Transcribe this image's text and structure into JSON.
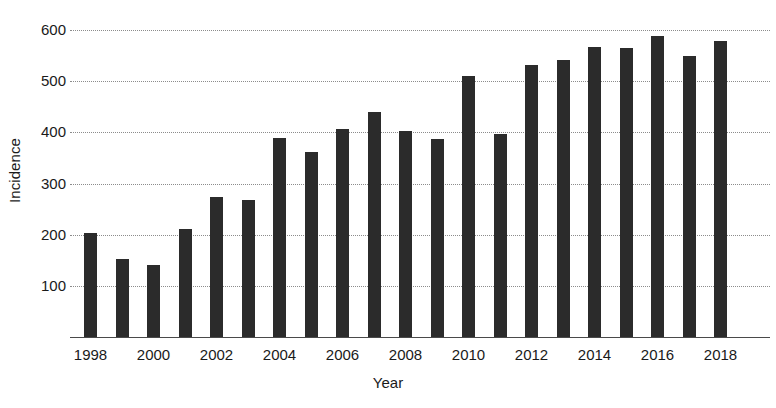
{
  "chart_data": {
    "type": "bar",
    "title": "",
    "xlabel": "Year",
    "ylabel": "Incidence",
    "categories": [
      1998,
      1999,
      2000,
      2001,
      2002,
      2003,
      2004,
      2005,
      2006,
      2007,
      2008,
      2009,
      2010,
      2011,
      2012,
      2013,
      2014,
      2015,
      2016,
      2017,
      2018
    ],
    "values": [
      204,
      152,
      140,
      212,
      273,
      268,
      389,
      361,
      407,
      441,
      402,
      388,
      510,
      398,
      532,
      541,
      568,
      566,
      588,
      549,
      578
    ],
    "ylim": [
      0,
      620
    ],
    "yticks": [
      100,
      200,
      300,
      400,
      500,
      600
    ],
    "ytick_labels": [
      "100",
      "200",
      "300",
      "400",
      "500",
      "600"
    ],
    "xtick_values": [
      1998,
      2000,
      2002,
      2004,
      2006,
      2008,
      2010,
      2012,
      2014,
      2016,
      2018
    ],
    "xtick_labels": [
      "1998",
      "2000",
      "2002",
      "2004",
      "2006",
      "2008",
      "2010",
      "2012",
      "2014",
      "2016",
      "2018"
    ],
    "grid": true,
    "grid_style": "dotted",
    "legend": null,
    "bar_color": "#2b2b2b",
    "grid_color": "#8c8c8c",
    "axis_color": "#4a4a4a",
    "background": "#ffffff"
  }
}
